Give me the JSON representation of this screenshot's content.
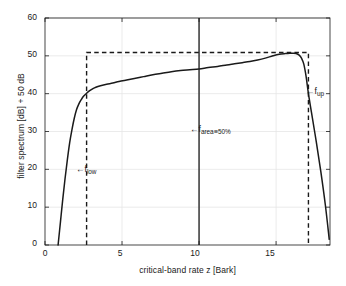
{
  "chart_data": {
    "type": "line",
    "title": "",
    "xlabel": "critical-band rate z [Bark]",
    "ylabel": "filter spectrum [dB] + 50 dB",
    "xlim": [
      0,
      18.5
    ],
    "ylim": [
      0,
      60
    ],
    "xticks": [
      0,
      5,
      10,
      15
    ],
    "xtick_labels": [
      "0",
      "5",
      "10",
      "15"
    ],
    "yticks": [
      0,
      10,
      20,
      30,
      40,
      50,
      60
    ],
    "ytick_labels": [
      "0",
      "10",
      "20",
      "30",
      "40",
      "50",
      "60"
    ],
    "grid": true,
    "legend": "none",
    "series": [
      {
        "name": "filter spectrum",
        "style": "solid",
        "color": "#1a1a1a",
        "x": [
          0.85,
          1.0,
          1.15,
          1.3,
          1.45,
          1.6,
          1.75,
          1.9,
          2.05,
          2.2,
          2.35,
          2.5,
          2.7,
          2.9,
          3.1,
          3.3,
          3.6,
          4.0,
          4.4,
          4.8,
          5.3,
          5.8,
          6.4,
          7.0,
          7.6,
          8.2,
          8.8,
          9.4,
          10.0,
          10.6,
          11.2,
          11.8,
          12.3,
          12.8,
          13.3,
          13.8,
          14.3,
          14.8,
          15.2,
          15.6,
          15.9,
          16.1,
          16.3,
          16.5,
          16.65,
          16.8,
          16.95,
          17.1,
          17.3,
          17.6,
          17.9,
          18.2,
          18.45
        ],
        "y": [
          0.0,
          6.0,
          12.0,
          17.5,
          22.5,
          27.0,
          30.5,
          33.5,
          35.8,
          37.3,
          38.4,
          39.3,
          40.1,
          40.8,
          41.3,
          41.7,
          42.1,
          42.5,
          42.8,
          43.2,
          43.6,
          44.0,
          44.5,
          45.0,
          45.4,
          45.8,
          46.1,
          46.3,
          46.5,
          46.9,
          47.2,
          47.6,
          47.9,
          48.2,
          48.5,
          48.9,
          49.4,
          50.0,
          50.4,
          50.6,
          50.7,
          50.7,
          50.6,
          50.2,
          49.4,
          47.8,
          44.5,
          40.0,
          35.0,
          27.5,
          19.5,
          10.5,
          1.5
        ]
      },
      {
        "name": "rectangular reference filter",
        "style": "dashed",
        "color": "#1a1a1a",
        "level": 50.9,
        "x_low": 2.7,
        "x_up": 17.1
      },
      {
        "name": "median area line",
        "style": "solid-vertical",
        "color": "#1a1a1a",
        "x": 10.0,
        "y_from": 0,
        "y_to": 60
      }
    ],
    "annotations": [
      {
        "id": "f-low",
        "arrow": "←",
        "symbol": "f",
        "subscript": "low",
        "relation": "",
        "value": "",
        "x": 2.7,
        "y": 20
      },
      {
        "id": "f-area",
        "arrow": "←",
        "symbol": "f",
        "subscript": "area",
        "relation": "≡",
        "value": "50%",
        "x": 10.0,
        "y": 30
      },
      {
        "id": "f-up",
        "arrow": "←",
        "symbol": "f",
        "subscript": "up",
        "relation": "",
        "value": "",
        "x": 17.1,
        "y": 35
      }
    ]
  },
  "style": {
    "axis_color": "#1a1a1a",
    "grid_color": "#e6e6e6",
    "curve_color": "#1a1a1a",
    "background": "#ffffff"
  }
}
